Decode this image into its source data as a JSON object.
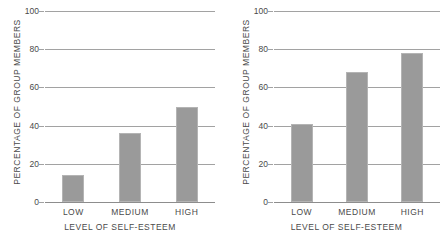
{
  "chart_data": [
    {
      "type": "bar",
      "panel": "left",
      "title": "",
      "categories": [
        "LOW",
        "MEDIUM",
        "HIGH"
      ],
      "values": [
        14,
        36,
        50
      ],
      "xlabel": "LEVEL OF SELF-ESTEEM",
      "ylabel": "PERCENTAGE OF GROUP MEMBERS",
      "ylim": [
        0,
        100
      ],
      "yticks": [
        0,
        20,
        40,
        60,
        80,
        100
      ],
      "ytick_labels": [
        "0",
        "20",
        "40",
        "60",
        "80",
        "100"
      ],
      "grid": true,
      "legend": "none",
      "bar_color": "#9a9a9a",
      "grid_color": "#a2a2a2"
    },
    {
      "type": "bar",
      "panel": "right",
      "title": "",
      "categories": [
        "LOW",
        "MEDIUM",
        "HIGH"
      ],
      "values": [
        41,
        68,
        78
      ],
      "xlabel": "LEVEL OF SELF-ESTEEM",
      "ylabel": "PERCENTAGE OF GROUP MEMBERS",
      "ylim": [
        0,
        100
      ],
      "yticks": [
        0,
        20,
        40,
        60,
        80,
        100
      ],
      "ytick_labels": [
        "0",
        "20",
        "40",
        "60",
        "80",
        "100"
      ],
      "grid": true,
      "legend": "none",
      "bar_color": "#9a9a9a",
      "grid_color": "#a2a2a2"
    }
  ]
}
